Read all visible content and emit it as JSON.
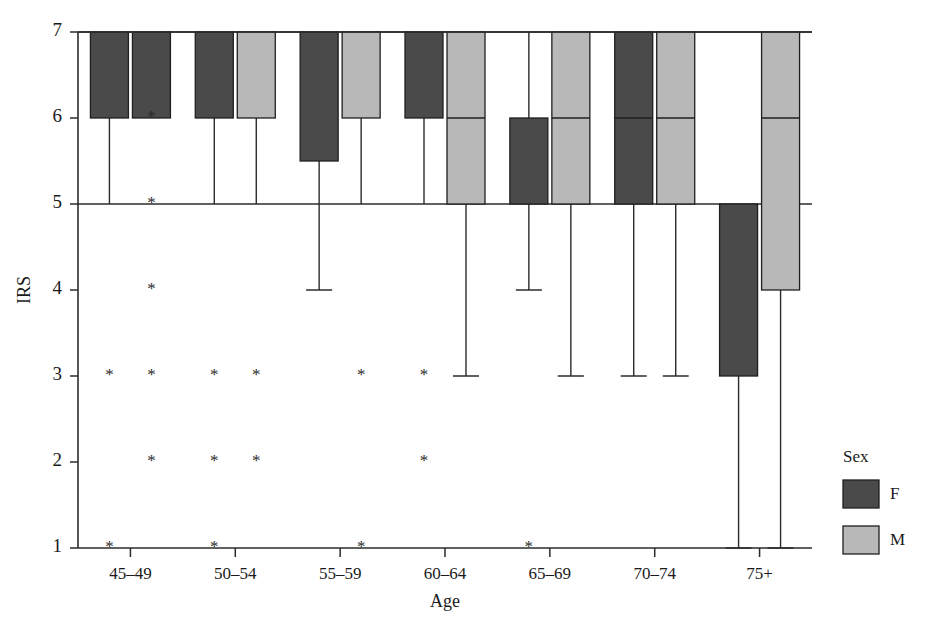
{
  "chart_data": {
    "type": "box",
    "title": "",
    "xlabel": "Age",
    "ylabel": "IRS",
    "ylim": [
      1,
      7
    ],
    "yticks": [
      1,
      2,
      3,
      4,
      5,
      6,
      7
    ],
    "ytick_labels": [
      "1",
      "2",
      "3",
      "4",
      "5",
      "6",
      "7"
    ],
    "categories": [
      "45–49",
      "50–54",
      "55–59",
      "60–64",
      "65–69",
      "70–74",
      "75+"
    ],
    "grid": false,
    "gridlines_at": [
      5,
      7
    ],
    "legend": {
      "title": "Sex",
      "position": "right",
      "entries": [
        {
          "name": "F",
          "label": "F",
          "color": "#4a4a4a"
        },
        {
          "name": "M",
          "label": "M",
          "color": "#b8b8b8"
        }
      ]
    },
    "series": [
      {
        "name": "F",
        "color": "#4a4a4a",
        "boxes": [
          {
            "category": "45–49",
            "q1": 6,
            "q3": 7,
            "median": 7,
            "whisker_low": 5,
            "whisker_high": 7,
            "cap_low": false,
            "cap_high": false
          },
          {
            "category": "50–54",
            "q1": 6,
            "q3": 7,
            "median": 7,
            "whisker_low": 5,
            "whisker_high": 7,
            "cap_low": false,
            "cap_high": false
          },
          {
            "category": "55–59",
            "q1": 5.5,
            "q3": 7,
            "median": 7,
            "whisker_low": 4,
            "whisker_high": 7,
            "cap_low": true,
            "cap_high": false
          },
          {
            "category": "60–64",
            "q1": 6,
            "q3": 7,
            "median": 7,
            "whisker_low": 5,
            "whisker_high": 7,
            "cap_low": false,
            "cap_high": false
          },
          {
            "category": "65–69",
            "q1": 5,
            "q3": 6,
            "median": 6,
            "whisker_low": 4,
            "whisker_high": 7,
            "cap_low": true,
            "cap_high": false
          },
          {
            "category": "70–74",
            "q1": 5,
            "q3": 7,
            "median": 6,
            "whisker_low": 3,
            "whisker_high": 7,
            "cap_low": true,
            "cap_high": false
          },
          {
            "category": "75+",
            "q1": 3,
            "q3": 5,
            "median": 5,
            "whisker_low": 1,
            "whisker_high": 5,
            "cap_low": true,
            "cap_high": false
          }
        ]
      },
      {
        "name": "M",
        "color": "#b8b8b8",
        "boxes": [
          {
            "category": "45–49",
            "q1": 6,
            "q3": 7,
            "median": 7,
            "whisker_low": 7,
            "whisker_high": 7,
            "cap_low": false,
            "cap_high": false,
            "dark_artifact": true
          },
          {
            "category": "50–54",
            "q1": 6,
            "q3": 7,
            "median": 7,
            "whisker_low": 5,
            "whisker_high": 7,
            "cap_low": false,
            "cap_high": false
          },
          {
            "category": "55–59",
            "q1": 6,
            "q3": 7,
            "median": 7,
            "whisker_low": 5,
            "whisker_high": 7,
            "cap_low": false,
            "cap_high": false
          },
          {
            "category": "60–64",
            "q1": 5,
            "q3": 7,
            "median": 6,
            "whisker_low": 3,
            "whisker_high": 7,
            "cap_low": true,
            "cap_high": false
          },
          {
            "category": "65–69",
            "q1": 5,
            "q3": 7,
            "median": 6,
            "whisker_low": 3,
            "whisker_high": 7,
            "cap_low": true,
            "cap_high": false
          },
          {
            "category": "70–74",
            "q1": 5,
            "q3": 7,
            "median": 6,
            "whisker_low": 3,
            "whisker_high": 7,
            "cap_low": true,
            "cap_high": false
          },
          {
            "category": "75+",
            "q1": 4,
            "q3": 7,
            "median": 6,
            "whisker_low": 1,
            "whisker_high": 7,
            "cap_low": true,
            "cap_high": false
          }
        ]
      }
    ],
    "outliers": [
      {
        "category": "45–49",
        "series": "M",
        "value": 6,
        "marker": "*"
      },
      {
        "category": "45–49",
        "series": "M",
        "value": 5,
        "marker": "*"
      },
      {
        "category": "45–49",
        "series": "M",
        "value": 4,
        "marker": "*"
      },
      {
        "category": "45–49",
        "series": "F",
        "value": 3,
        "marker": "*"
      },
      {
        "category": "45–49",
        "series": "M",
        "value": 3,
        "marker": "*"
      },
      {
        "category": "45–49",
        "series": "M",
        "value": 2,
        "marker": "*"
      },
      {
        "category": "45–49",
        "series": "F",
        "value": 1,
        "marker": "*"
      },
      {
        "category": "50–54",
        "series": "F",
        "value": 3,
        "marker": "*"
      },
      {
        "category": "50–54",
        "series": "M",
        "value": 3,
        "marker": "*"
      },
      {
        "category": "50–54",
        "series": "F",
        "value": 2,
        "marker": "*"
      },
      {
        "category": "50–54",
        "series": "M",
        "value": 2,
        "marker": "*"
      },
      {
        "category": "50–54",
        "series": "F",
        "value": 1,
        "marker": "*"
      },
      {
        "category": "55–59",
        "series": "M",
        "value": 3,
        "marker": "*"
      },
      {
        "category": "55–59",
        "series": "M",
        "value": 1,
        "marker": "*"
      },
      {
        "category": "60–64",
        "series": "F",
        "value": 3,
        "marker": "*"
      },
      {
        "category": "60–64",
        "series": "F",
        "value": 2,
        "marker": "*"
      },
      {
        "category": "65–69",
        "series": "F",
        "value": 1,
        "marker": "*"
      }
    ]
  }
}
